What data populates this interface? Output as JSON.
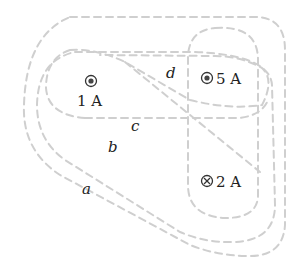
{
  "diagram": {
    "type": "ampere-loops",
    "wires": [
      {
        "id": "w1",
        "label": "1 A",
        "direction": "out-of-page",
        "symbol": "dot-in-circle"
      },
      {
        "id": "w5",
        "label": "5 A",
        "direction": "out-of-page",
        "symbol": "dot-in-circle"
      },
      {
        "id": "w2",
        "label": "2 A",
        "direction": "into-page",
        "symbol": "cross-in-circle"
      }
    ],
    "loops": [
      {
        "id": "a",
        "label": "a"
      },
      {
        "id": "b",
        "label": "b"
      },
      {
        "id": "c",
        "label": "c"
      },
      {
        "id": "d",
        "label": "d"
      }
    ],
    "colors": {
      "loop_stroke": "#cfcfcf",
      "text": "#222222"
    }
  }
}
